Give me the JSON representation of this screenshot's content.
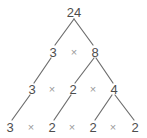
{
  "diagram": {
    "type": "factor-tree",
    "background_color": "#ffffff",
    "node_color": "#4d4d4d",
    "operator_color": "#9a9a9a",
    "edge_color": "#6e6e6e",
    "operator_symbol": "×",
    "levels": [
      {
        "level": 1,
        "nodes": [
          {
            "label": "24",
            "x": 74,
            "y": 12
          }
        ],
        "operators": []
      },
      {
        "level": 2,
        "nodes": [
          {
            "label": "3",
            "x": 53,
            "y": 52
          },
          {
            "label": "8",
            "x": 95,
            "y": 52
          }
        ],
        "operators": [
          {
            "label": "×",
            "x": 74,
            "y": 52
          }
        ]
      },
      {
        "level": 3,
        "nodes": [
          {
            "label": "3",
            "x": 32,
            "y": 89
          },
          {
            "label": "2",
            "x": 73,
            "y": 89
          },
          {
            "label": "4",
            "x": 114,
            "y": 89
          }
        ],
        "operators": [
          {
            "label": "×",
            "x": 52,
            "y": 89
          },
          {
            "label": "×",
            "x": 93,
            "y": 89
          }
        ]
      },
      {
        "level": 4,
        "nodes": [
          {
            "label": "3",
            "x": 10,
            "y": 127
          },
          {
            "label": "2",
            "x": 52,
            "y": 127
          },
          {
            "label": "2",
            "x": 93,
            "y": 127
          },
          {
            "label": "2",
            "x": 135,
            "y": 127
          }
        ],
        "operators": [
          {
            "label": "×",
            "x": 31,
            "y": 127
          },
          {
            "label": "×",
            "x": 72,
            "y": 127
          },
          {
            "label": "×",
            "x": 113,
            "y": 127
          }
        ]
      }
    ],
    "edges": [
      {
        "from": "24",
        "to": "3",
        "x1": 74,
        "y1": 19,
        "x2": 55,
        "y2": 45
      },
      {
        "from": "24",
        "to": "8",
        "x1": 74,
        "y1": 19,
        "x2": 93,
        "y2": 45
      },
      {
        "from": "3",
        "to": "3",
        "x1": 51,
        "y1": 58,
        "x2": 34,
        "y2": 83
      },
      {
        "from": "8",
        "to": "2",
        "x1": 94,
        "y1": 58,
        "x2": 75,
        "y2": 83
      },
      {
        "from": "8",
        "to": "4",
        "x1": 96,
        "y1": 58,
        "x2": 113,
        "y2": 83
      },
      {
        "from": "3",
        "to": "3b",
        "x1": 30,
        "y1": 95,
        "x2": 12,
        "y2": 120
      },
      {
        "from": "2",
        "to": "2b",
        "x1": 71,
        "y1": 95,
        "x2": 54,
        "y2": 120
      },
      {
        "from": "4",
        "to": "2c",
        "x1": 112,
        "y1": 95,
        "x2": 95,
        "y2": 120
      },
      {
        "from": "4",
        "to": "2d",
        "x1": 115,
        "y1": 95,
        "x2": 134,
        "y2": 120
      }
    ]
  }
}
